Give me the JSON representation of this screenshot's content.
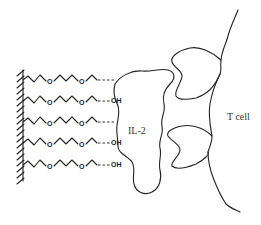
{
  "diagram": {
    "labels": {
      "protein": "IL-2",
      "cell": "T cell",
      "hydroxyl": "OH",
      "oxygen": "O"
    },
    "chains": [
      {
        "y": 80,
        "terminal": "bound"
      },
      {
        "y": 101,
        "terminal": "OH"
      },
      {
        "y": 122,
        "terminal": "bound"
      },
      {
        "y": 143,
        "terminal": "OH"
      },
      {
        "y": 165,
        "terminal": "OH"
      }
    ],
    "colors": {
      "stroke": "#222222",
      "background": "#ffffff"
    }
  }
}
